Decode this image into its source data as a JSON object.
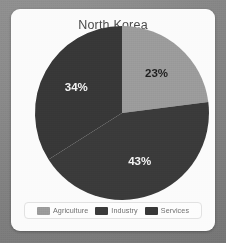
{
  "card": {
    "title": "North Korea"
  },
  "chart_data": {
    "type": "pie",
    "title": "North Korea",
    "categories": [
      "Agriculture",
      "Industry",
      "Services"
    ],
    "values": [
      23,
      43,
      34
    ],
    "value_labels": [
      "23%",
      "43%",
      "34%"
    ],
    "unit": "percent",
    "start_angle_deg": 0,
    "direction": "clockwise",
    "colors": [
      "#9b9b9b",
      "#3a3a3a",
      "#373737"
    ],
    "label_colors": [
      "#1e1e1e",
      "#f4f4f4",
      "#f4f4f4"
    ],
    "legend_position": "bottom",
    "grid": false,
    "xlabel": "",
    "ylabel": ""
  },
  "legend": {
    "items": [
      {
        "label": "Agriculture",
        "color": "#9b9b9b"
      },
      {
        "label": "Industry",
        "color": "#3a3a3a"
      },
      {
        "label": "Services",
        "color": "#373737"
      }
    ]
  },
  "theme": {
    "page_background": "#848484",
    "card_background": "#fbfbfb",
    "title_color": "#4a4a4a",
    "legend_text_color": "#6d6d6d"
  }
}
